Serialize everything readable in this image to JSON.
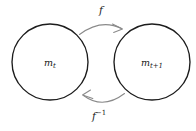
{
  "diagram": {
    "type": "commutative-map-diagram",
    "background_color": "#ffffff",
    "nodes": [
      {
        "id": "left-node",
        "name": "node-m-t",
        "label_base": "m",
        "label_sub": "t",
        "label_full": "m_t",
        "shape": "circle",
        "cx": 50,
        "cy": 62,
        "r": 38,
        "stroke_color": "#1c1c1c",
        "fill_color": "#ffffff"
      },
      {
        "id": "right-node",
        "name": "node-m-t-plus-1",
        "label_base": "m",
        "label_sub": "t+1",
        "label_full": "m_{t+1}",
        "shape": "circle",
        "cx": 152,
        "cy": 62,
        "r": 38,
        "stroke_color": "#1c1c1c",
        "fill_color": "#ffffff"
      }
    ],
    "edges": [
      {
        "id": "forward-edge",
        "name": "arrow-forward-f",
        "label_base": "f",
        "label_sup": "",
        "label_full": "f",
        "from": "left-node",
        "to": "right-node",
        "direction": "left-to-right",
        "position": "top",
        "curvature": "arc-upward",
        "stroke_color": "#8a8a8a",
        "label_x": 101,
        "label_y": 11
      },
      {
        "id": "inverse-edge",
        "name": "arrow-inverse-f",
        "label_base": "f",
        "label_sup": "−1",
        "label_full": "f^{-1}",
        "from": "right-node",
        "to": "left-node",
        "direction": "right-to-left",
        "position": "bottom",
        "curvature": "arc-downward",
        "stroke_color": "#8a8a8a",
        "label_x": 99,
        "label_y": 117
      }
    ]
  }
}
